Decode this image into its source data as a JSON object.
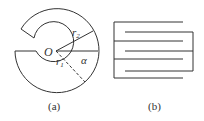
{
  "figure_a": {
    "caption": "(a)",
    "center_label": "O",
    "outer_radius_label": "r",
    "outer_radius_sub": "2",
    "inner_radius_label": "r",
    "inner_radius_sub": "1",
    "angle_label": "α"
  },
  "figure_b": {
    "caption": "(b)"
  },
  "colors": {
    "stroke": "#333333",
    "background": "#ffffff"
  }
}
